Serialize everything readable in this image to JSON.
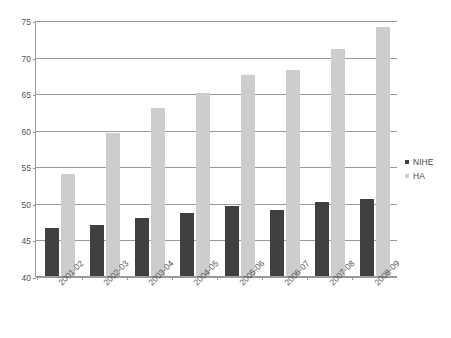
{
  "chart_data": {
    "type": "bar",
    "title": "",
    "xlabel": "",
    "ylabel": "",
    "ylim": [
      40,
      75
    ],
    "yticks": [
      40,
      45,
      50,
      55,
      60,
      65,
      70,
      75
    ],
    "grid": true,
    "legend_position": "right",
    "categories": [
      "2001-02",
      "2002-03",
      "2003-04",
      "2004-05",
      "2005-06",
      "2006-07",
      "2007-08",
      "2008-09"
    ],
    "series": [
      {
        "name": "NIHE",
        "color": "#404040",
        "values": [
          46.5,
          47.0,
          48.0,
          48.6,
          49.6,
          49.0,
          50.1,
          50.5
        ]
      },
      {
        "name": "HA",
        "color": "#cdcdcd",
        "values": [
          54.0,
          59.6,
          63.0,
          65.0,
          67.5,
          68.1,
          71.0,
          74.0
        ]
      }
    ]
  },
  "axis": {
    "y_tick_labels": [
      "75",
      "70",
      "65",
      "60",
      "55",
      "50",
      "45",
      "40"
    ]
  },
  "legend": {
    "items": [
      {
        "label": "NIHE",
        "color": "#404040"
      },
      {
        "label": "HA",
        "color": "#cdcdcd"
      }
    ]
  }
}
